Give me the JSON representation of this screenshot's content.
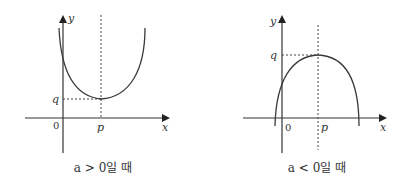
{
  "figures": [
    {
      "id": "upward",
      "axis_x_label": "x",
      "axis_y_label": "y",
      "origin_label": "0",
      "vertex_x_label": "p",
      "vertex_y_label": "q",
      "caption": "a > 0일 때",
      "opens": "up"
    },
    {
      "id": "downward",
      "axis_x_label": "x",
      "axis_y_label": "y",
      "origin_label": "0",
      "vertex_x_label": "p",
      "vertex_y_label": "q",
      "caption": "a < 0일 때",
      "opens": "down"
    }
  ]
}
